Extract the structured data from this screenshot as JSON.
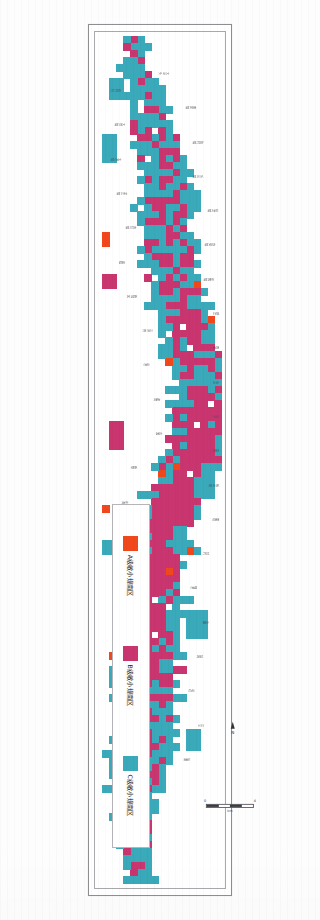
{
  "document": {
    "type": "scanned-map-figure",
    "orientation": "rotated-90",
    "page_background": "#fdfdfd"
  },
  "map": {
    "title": "",
    "frame": {
      "outer_color": "#8f8f93",
      "inner_color": "#a9a9ad"
    },
    "background": "#ffffff"
  },
  "colors": {
    "grade_a": "#F0481C",
    "grade_b": "#C9356E",
    "grade_c": "#3AA9BA",
    "label_text": "#4a4a50",
    "frame": "#8f8f93"
  },
  "legend": {
    "items": [
      {
        "key": "grade_a",
        "label": "A级敏小规南区",
        "color": "#F0481C"
      },
      {
        "key": "grade_b",
        "label": "B级敏小规南区",
        "color": "#C9356E"
      },
      {
        "key": "grade_c",
        "label": "C级敏小规南区",
        "color": "#3AA9BA"
      }
    ]
  },
  "scale": {
    "left_tick": "0",
    "right_tick": "4",
    "unit": "km"
  },
  "north_arrow": {
    "label": "N"
  },
  "place_labels": [
    "大沙头",
    "石井村",
    "南庄镇",
    "大良镇",
    "陈村镇",
    "北滘镇",
    "乐从镇",
    "龙江镇",
    "勒流镇",
    "杏坛镇",
    "均安镇",
    "容桂",
    "伦教镇",
    "新城区",
    "碧江",
    "三洪奇",
    "西海",
    "沙滘",
    "五沙",
    "逢简",
    "马宁",
    "右滩",
    "高赞",
    "新联",
    "板沙尾",
    "东海",
    "黄连",
    "上涌",
    "甘竹",
    "南沙",
    "细滘",
    "桂洲",
    "水藤",
    "龙洲",
    "扶闾",
    "鹤岭",
    "沙边",
    "平步",
    "江义",
    "南朗",
    "仙涌",
    "大晚"
  ],
  "chart_data": {
    "type": "heatmap",
    "categories": [
      "A级敏小规南区",
      "B级敏小规南区",
      "C级敏小规南区"
    ],
    "values": [
      14,
      186,
      214
    ],
    "xlabel": "",
    "ylabel": "",
    "legend_position": "bottom-right"
  }
}
